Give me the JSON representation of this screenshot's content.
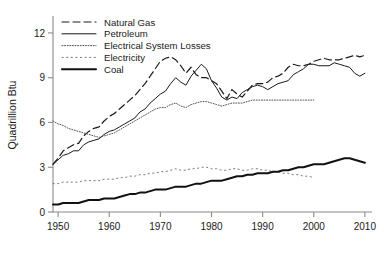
{
  "chart_data": {
    "type": "line",
    "title": "",
    "xlabel": "",
    "ylabel": "Quadrillion Btu",
    "xlim": [
      1949,
      2011
    ],
    "ylim": [
      0,
      13
    ],
    "xticks": [
      1950,
      1960,
      1970,
      1980,
      1990,
      2000,
      2010
    ],
    "xticklabels": [
      "1950",
      "1960",
      "1970",
      "1980",
      "1990",
      "2000",
      "2010"
    ],
    "yticks": [
      0,
      3,
      6,
      9,
      12
    ],
    "yticklabels": [
      "0",
      "3",
      "6",
      "9",
      "12"
    ],
    "grid": false,
    "legend_position": "upper left",
    "series": [
      {
        "name": "Natural Gas",
        "style": "dashed",
        "color": "#1a1a1a",
        "width": 1.2,
        "x": [
          1949,
          1950,
          1951,
          1952,
          1953,
          1954,
          1955,
          1956,
          1957,
          1958,
          1959,
          1960,
          1961,
          1962,
          1963,
          1964,
          1965,
          1966,
          1967,
          1968,
          1969,
          1970,
          1971,
          1972,
          1973,
          1974,
          1975,
          1976,
          1977,
          1978,
          1979,
          1980,
          1981,
          1982,
          1983,
          1984,
          1985,
          1986,
          1987,
          1988,
          1989,
          1990,
          1991,
          1992,
          1993,
          1994,
          1995,
          1996,
          1997,
          1998,
          1999,
          2000,
          2001,
          2002,
          2003,
          2004,
          2005,
          2006,
          2007,
          2008,
          2009,
          2010
        ],
        "values": [
          3.2,
          3.6,
          4.1,
          4.3,
          4.5,
          4.6,
          5.1,
          5.4,
          5.6,
          5.7,
          6.1,
          6.4,
          6.6,
          6.9,
          7.2,
          7.5,
          7.8,
          8.2,
          8.6,
          9.1,
          9.6,
          10.1,
          10.3,
          10.4,
          10.2,
          9.8,
          9.3,
          9.7,
          9.2,
          9.0,
          9.0,
          8.8,
          8.6,
          8.1,
          7.6,
          8.2,
          7.9,
          7.7,
          8.1,
          8.5,
          8.6,
          8.6,
          8.7,
          9.0,
          9.1,
          9.3,
          9.7,
          9.9,
          9.8,
          9.8,
          9.9,
          10.1,
          10.2,
          10.3,
          10.2,
          10.2,
          10.2,
          10.3,
          10.4,
          10.5,
          10.4,
          10.5
        ]
      },
      {
        "name": "Petroleum",
        "style": "solid-thin",
        "color": "#1a1a1a",
        "width": 1.0,
        "x": [
          1949,
          1950,
          1951,
          1952,
          1953,
          1954,
          1955,
          1956,
          1957,
          1958,
          1959,
          1960,
          1961,
          1962,
          1963,
          1964,
          1965,
          1966,
          1967,
          1968,
          1969,
          1970,
          1971,
          1972,
          1973,
          1974,
          1975,
          1976,
          1977,
          1978,
          1979,
          1980,
          1981,
          1982,
          1983,
          1984,
          1985,
          1986,
          1987,
          1988,
          1989,
          1990,
          1991,
          1992,
          1993,
          1994,
          1995,
          1996,
          1997,
          1998,
          1999,
          2000,
          2001,
          2002,
          2003,
          2004,
          2005,
          2006,
          2007,
          2008,
          2009,
          2010
        ],
        "values": [
          3.2,
          3.5,
          3.8,
          3.9,
          4.1,
          4.1,
          4.5,
          4.7,
          4.8,
          4.9,
          5.2,
          5.4,
          5.5,
          5.7,
          5.9,
          6.1,
          6.3,
          6.7,
          6.9,
          7.3,
          7.6,
          7.9,
          8.1,
          8.6,
          9.0,
          8.7,
          8.5,
          9.1,
          9.5,
          9.9,
          9.6,
          8.8,
          8.3,
          7.7,
          7.5,
          7.7,
          7.6,
          8.0,
          8.2,
          8.4,
          8.5,
          8.4,
          8.2,
          8.4,
          8.6,
          8.7,
          8.8,
          9.2,
          9.4,
          9.6,
          9.9,
          9.9,
          9.8,
          9.8,
          9.8,
          10.0,
          9.9,
          9.8,
          9.7,
          9.3,
          9.1,
          9.3
        ]
      },
      {
        "name": "Electrical System Losses",
        "style": "dotted-fine",
        "color": "#555555",
        "width": 1.0,
        "x": [
          1949,
          1950,
          1951,
          1952,
          1953,
          1954,
          1955,
          1956,
          1957,
          1958,
          1959,
          1960,
          1961,
          1962,
          1963,
          1964,
          1965,
          1966,
          1967,
          1968,
          1969,
          1970,
          1971,
          1972,
          1973,
          1974,
          1975,
          1976,
          1977,
          1978,
          1979,
          1980,
          1981,
          1982,
          1983,
          1984,
          1985,
          1986,
          1987,
          1988,
          1989,
          1990,
          1991,
          1992,
          1993,
          1994,
          1995,
          1996,
          1997,
          1998,
          1999,
          2000
        ],
        "values": [
          6.1,
          5.9,
          5.8,
          5.6,
          5.5,
          5.4,
          5.3,
          5.2,
          5.1,
          5.0,
          5.1,
          5.2,
          5.3,
          5.5,
          5.7,
          5.9,
          6.1,
          6.3,
          6.5,
          6.7,
          6.9,
          7.0,
          7.0,
          7.2,
          7.3,
          7.1,
          7.0,
          7.2,
          7.3,
          7.4,
          7.4,
          7.3,
          7.2,
          7.1,
          7.2,
          7.3,
          7.3,
          7.3,
          7.4,
          7.5,
          7.5,
          7.5,
          7.5,
          7.5,
          7.5,
          7.5,
          7.5,
          7.5,
          7.5,
          7.5,
          7.5,
          7.5
        ]
      },
      {
        "name": "Electricity",
        "style": "dotted-sparse",
        "color": "#777777",
        "width": 1.0,
        "x": [
          1949,
          1950,
          1951,
          1952,
          1953,
          1954,
          1955,
          1956,
          1957,
          1958,
          1959,
          1960,
          1961,
          1962,
          1963,
          1964,
          1965,
          1966,
          1967,
          1968,
          1969,
          1970,
          1971,
          1972,
          1973,
          1974,
          1975,
          1976,
          1977,
          1978,
          1979,
          1980,
          1981,
          1982,
          1983,
          1984,
          1985,
          1986,
          1987,
          1988,
          1989,
          1990,
          1991,
          1992,
          1993,
          1994,
          1995,
          1996,
          1997,
          1998,
          1999,
          2000
        ],
        "values": [
          1.9,
          1.9,
          2.0,
          2.0,
          2.0,
          2.0,
          2.1,
          2.1,
          2.1,
          2.1,
          2.2,
          2.2,
          2.2,
          2.3,
          2.3,
          2.4,
          2.4,
          2.5,
          2.5,
          2.6,
          2.6,
          2.7,
          2.7,
          2.8,
          2.9,
          2.8,
          2.8,
          2.9,
          2.9,
          3.0,
          3.0,
          2.9,
          2.9,
          2.8,
          2.8,
          2.9,
          2.9,
          2.8,
          2.8,
          2.9,
          2.9,
          2.8,
          2.8,
          2.7,
          2.7,
          2.6,
          2.6,
          2.5,
          2.5,
          2.4,
          2.4,
          2.3
        ]
      },
      {
        "name": "Coal",
        "style": "solid-thick",
        "color": "#111111",
        "width": 2.0,
        "x": [
          1949,
          1950,
          1951,
          1952,
          1953,
          1954,
          1955,
          1956,
          1957,
          1958,
          1959,
          1960,
          1961,
          1962,
          1963,
          1964,
          1965,
          1966,
          1967,
          1968,
          1969,
          1970,
          1971,
          1972,
          1973,
          1974,
          1975,
          1976,
          1977,
          1978,
          1979,
          1980,
          1981,
          1982,
          1983,
          1984,
          1985,
          1986,
          1987,
          1988,
          1989,
          1990,
          1991,
          1992,
          1993,
          1994,
          1995,
          1996,
          1997,
          1998,
          1999,
          2000,
          2001,
          2002,
          2003,
          2004,
          2005,
          2006,
          2007,
          2008,
          2009,
          2010
        ],
        "values": [
          0.5,
          0.5,
          0.6,
          0.6,
          0.6,
          0.6,
          0.7,
          0.8,
          0.8,
          0.8,
          0.9,
          0.9,
          0.9,
          1.0,
          1.1,
          1.2,
          1.2,
          1.3,
          1.3,
          1.4,
          1.5,
          1.5,
          1.5,
          1.6,
          1.7,
          1.7,
          1.7,
          1.8,
          1.9,
          1.9,
          2.0,
          2.1,
          2.1,
          2.1,
          2.2,
          2.3,
          2.4,
          2.4,
          2.5,
          2.5,
          2.6,
          2.6,
          2.6,
          2.7,
          2.7,
          2.8,
          2.8,
          2.9,
          3.0,
          3.0,
          3.1,
          3.2,
          3.2,
          3.2,
          3.3,
          3.4,
          3.5,
          3.6,
          3.6,
          3.5,
          3.4,
          3.3
        ]
      }
    ]
  },
  "axis": {
    "ylabel": "Quadrillion Btu"
  }
}
